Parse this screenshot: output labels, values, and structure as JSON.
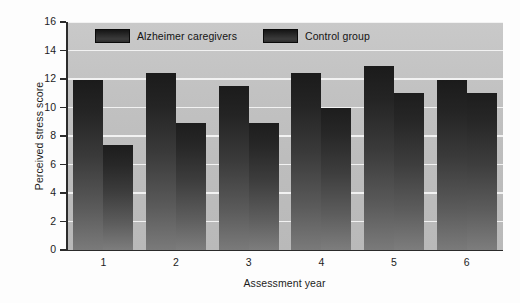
{
  "chart_data": {
    "type": "bar",
    "title": "",
    "xlabel": "Assessment year",
    "ylabel": "Perceived stress score",
    "categories": [
      "1",
      "2",
      "3",
      "4",
      "5",
      "6"
    ],
    "ylim": [
      0,
      16
    ],
    "yticks": [
      0,
      2,
      4,
      6,
      8,
      10,
      12,
      14,
      16
    ],
    "grid": true,
    "legend_position": "top-inside",
    "series": [
      {
        "name": "Alzheimer caregivers",
        "values": [
          11.9,
          12.4,
          11.5,
          12.4,
          12.9,
          11.9
        ]
      },
      {
        "name": "Control group",
        "values": [
          7.4,
          8.9,
          8.9,
          10.0,
          11.0,
          11.0
        ]
      }
    ]
  },
  "legend": {
    "items": [
      {
        "label": "Alzheimer caregivers"
      },
      {
        "label": "Control group"
      }
    ]
  },
  "colors": {
    "bar_dark": "#1b1b1b",
    "bar_light": "#7a7a7a",
    "plot_background": "#c2c2c2",
    "gridline": "#f2f2f2",
    "axis": "#2b2b2b",
    "text": "#1c1c1c"
  }
}
